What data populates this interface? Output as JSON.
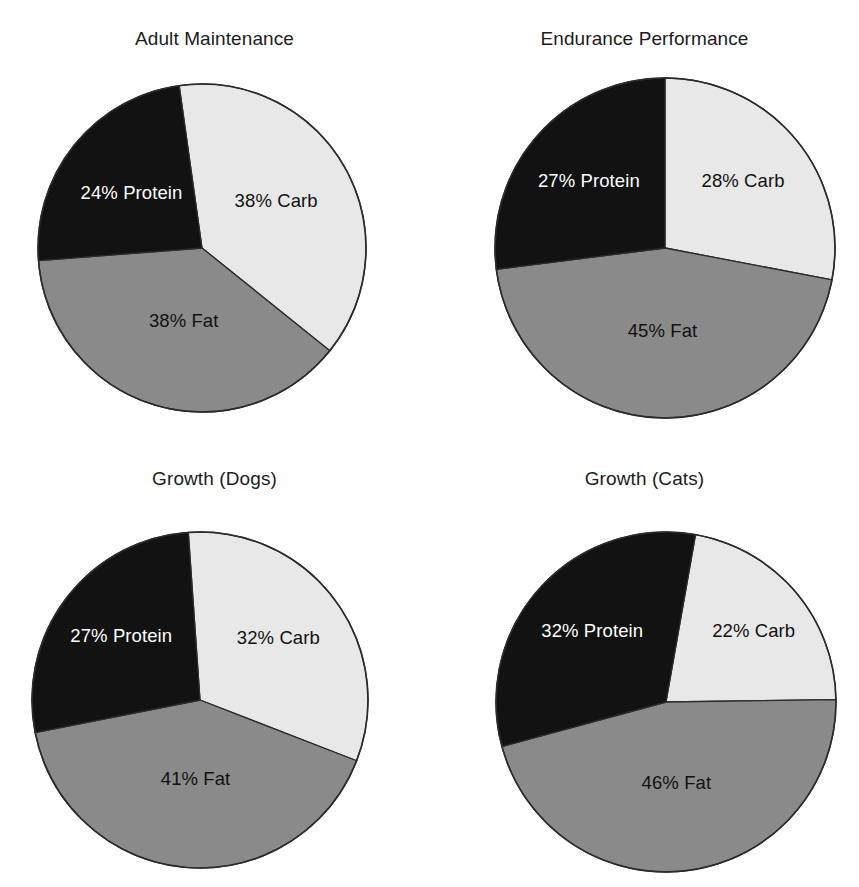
{
  "page": {
    "background": "#ffffff",
    "layout": "2x2-grid-of-pie-charts"
  },
  "palette": {
    "carb": "#e8e8e8",
    "fat": "#8a8a8a",
    "protein": "#121212",
    "outline": "#2b2b2b",
    "label_on_dark": "#ffffff",
    "label_on_light": "#111111",
    "title": "#1c1c1c"
  },
  "charts": [
    {
      "id": "adult-maintenance",
      "title": "Adult Maintenance",
      "center": {
        "x": 202,
        "y": 248
      },
      "radius": 164,
      "start_angle": -8,
      "slices": [
        {
          "key": "carb",
          "label": "38% Carb",
          "value": 38,
          "color": "#e8e8e8",
          "label_color": "light",
          "label_r": 0.52,
          "label_nudge_x": 0,
          "label_nudge_y": -4
        },
        {
          "key": "fat",
          "label": "38% Fat",
          "value": 38,
          "color": "#8a8a8a",
          "label_color": "light",
          "label_r": 0.46,
          "label_nudge_x": 4,
          "label_nudge_y": 2
        },
        {
          "key": "protein",
          "label": "24% Protein",
          "value": 24,
          "color": "#121212",
          "label_color": "dark",
          "label_r": 0.52,
          "label_nudge_x": -4,
          "label_nudge_y": 0
        }
      ]
    },
    {
      "id": "endurance-performance",
      "title": "Endurance Performance",
      "center": {
        "x": 235,
        "y": 248
      },
      "radius": 170,
      "start_angle": 0,
      "slices": [
        {
          "key": "carb",
          "label": "28% Carb",
          "value": 28,
          "color": "#e8e8e8",
          "label_color": "light",
          "label_r": 0.55,
          "label_nudge_x": 6,
          "label_nudge_y": -6
        },
        {
          "key": "fat",
          "label": "45% Fat",
          "value": 45,
          "color": "#8a8a8a",
          "label_color": "light",
          "label_r": 0.46,
          "label_nudge_x": 0,
          "label_nudge_y": 6
        },
        {
          "key": "protein",
          "label": "27% Protein",
          "value": 27,
          "color": "#121212",
          "label_color": "dark",
          "label_r": 0.55,
          "label_nudge_x": -6,
          "label_nudge_y": -4
        }
      ]
    },
    {
      "id": "growth-dogs",
      "title": "Growth (Dogs)",
      "center": {
        "x": 200,
        "y": 253
      },
      "radius": 168,
      "start_angle": -4,
      "slices": [
        {
          "key": "carb",
          "label": "32% Carb",
          "value": 32,
          "color": "#e8e8e8",
          "label_color": "light",
          "label_r": 0.55,
          "label_nudge_x": 4,
          "label_nudge_y": -6
        },
        {
          "key": "fat",
          "label": "41% Fat",
          "value": 41,
          "color": "#8a8a8a",
          "label_color": "light",
          "label_r": 0.44,
          "label_nudge_x": 2,
          "label_nudge_y": 6
        },
        {
          "key": "protein",
          "label": "27%  Protein",
          "value": 27,
          "color": "#121212",
          "label_color": "dark",
          "label_r": 0.56,
          "label_nudge_x": -4,
          "label_nudge_y": -6
        }
      ]
    },
    {
      "id": "growth-cats",
      "title": "Growth (Cats)",
      "center": {
        "x": 236,
        "y": 255
      },
      "radius": 170,
      "start_angle": 10,
      "slices": [
        {
          "key": "carb",
          "label": "22% Carb",
          "value": 22,
          "color": "#e8e8e8",
          "label_color": "light",
          "label_r": 0.6,
          "label_nudge_x": 10,
          "label_nudge_y": -4
        },
        {
          "key": "fat",
          "label": "46% Fat",
          "value": 46,
          "color": "#8a8a8a",
          "label_color": "light",
          "label_r": 0.44,
          "label_nudge_x": 0,
          "label_nudge_y": 8
        },
        {
          "key": "protein",
          "label": "32% Protein",
          "value": 32,
          "color": "#121212",
          "label_color": "dark",
          "label_r": 0.54,
          "label_nudge_x": -6,
          "label_nudge_y": -8
        }
      ]
    }
  ],
  "chart_data": [
    {
      "type": "pie",
      "title": "Adult Maintenance",
      "categories": [
        "Carb",
        "Fat",
        "Protein"
      ],
      "values": [
        38,
        38,
        24
      ],
      "unit": "percent",
      "data_labels": [
        "38% Carb",
        "38% Fat",
        "24% Protein"
      ],
      "colors": [
        "#e8e8e8",
        "#8a8a8a",
        "#121212"
      ],
      "legend": "none (labels drawn inside slices)",
      "total": 100
    },
    {
      "type": "pie",
      "title": "Endurance Performance",
      "categories": [
        "Carb",
        "Fat",
        "Protein"
      ],
      "values": [
        28,
        45,
        27
      ],
      "unit": "percent",
      "data_labels": [
        "28% Carb",
        "45% Fat",
        "27% Protein"
      ],
      "colors": [
        "#e8e8e8",
        "#8a8a8a",
        "#121212"
      ],
      "legend": "none (labels drawn inside slices)",
      "total": 100
    },
    {
      "type": "pie",
      "title": "Growth (Dogs)",
      "categories": [
        "Carb",
        "Fat",
        "Protein"
      ],
      "values": [
        32,
        41,
        27
      ],
      "unit": "percent",
      "data_labels": [
        "32% Carb",
        "41% Fat",
        "27%  Protein"
      ],
      "colors": [
        "#e8e8e8",
        "#8a8a8a",
        "#121212"
      ],
      "legend": "none (labels drawn inside slices)",
      "total": 100
    },
    {
      "type": "pie",
      "title": "Growth (Cats)",
      "categories": [
        "Carb",
        "Fat",
        "Protein"
      ],
      "values": [
        22,
        46,
        32
      ],
      "unit": "percent",
      "data_labels": [
        "22% Carb",
        "46% Fat",
        "32% Protein"
      ],
      "colors": [
        "#e8e8e8",
        "#8a8a8a",
        "#121212"
      ],
      "legend": "none (labels drawn inside slices)",
      "total": 100
    }
  ]
}
